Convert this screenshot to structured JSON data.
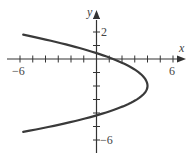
{
  "chart_data": {
    "type": "line",
    "title": "",
    "xlabel": "x",
    "ylabel": "y",
    "equation": "x = 4 - (1/2)(y + 2)^2",
    "xlim": [
      -6,
      6
    ],
    "ylim": [
      -7,
      3
    ],
    "x_tick_labels": [
      {
        "value": -6,
        "label": "−6"
      },
      {
        "value": 6,
        "label": "6"
      }
    ],
    "y_tick_labels": [
      {
        "value": 2,
        "label": "2"
      },
      {
        "value": -6,
        "label": "−6"
      }
    ],
    "grid": false,
    "series": [
      {
        "name": "parabola",
        "color": "#3a3a3a",
        "points": [
          {
            "x": -5.75,
            "y": 1.8
          },
          {
            "x": 0,
            "y": 0.8
          },
          {
            "x": 2.2,
            "y": 0
          },
          {
            "x": 4,
            "y": -2
          },
          {
            "x": 0,
            "y": -4.3
          },
          {
            "x": -5.75,
            "y": -5.4
          }
        ],
        "vertex": {
          "x": 4,
          "y": -2
        },
        "x_intercept": 2,
        "y_intercepts": [
          0.8,
          -4.8
        ]
      }
    ]
  },
  "labels": {
    "x_axis": "x",
    "y_axis": "y",
    "x_min": "−6",
    "x_max": "6",
    "y_top": "2",
    "y_bottom": "−6"
  },
  "colors": {
    "axis": "#333333",
    "curve": "#3a3a3a",
    "text": "#444444"
  }
}
